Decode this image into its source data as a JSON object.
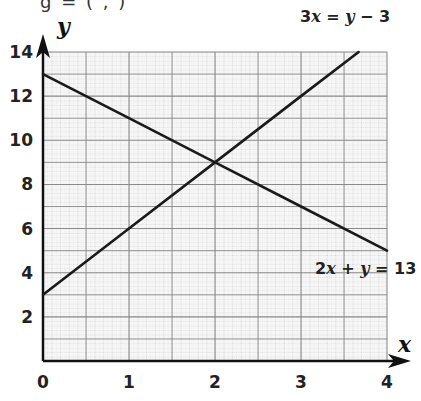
{
  "top_fragment": "g = ( , )",
  "chart_data": {
    "type": "line",
    "title": "",
    "xlabel": "x",
    "ylabel": "y",
    "xlim": [
      0,
      4
    ],
    "ylim": [
      0,
      14
    ],
    "x_ticks": [
      "0",
      "1",
      "2",
      "3",
      "4"
    ],
    "y_ticks": [
      "2",
      "4",
      "6",
      "8",
      "10",
      "12",
      "14"
    ],
    "grid": true,
    "legend_position": "inline labels",
    "series": [
      {
        "name": "3x = y − 3",
        "equation": "y = 3x + 3",
        "label_parts": [
          "3",
          "x",
          " = ",
          "y",
          " − 3"
        ],
        "x": [
          0,
          1,
          2,
          3,
          3.67
        ],
        "values": [
          3,
          6,
          9,
          12,
          14
        ]
      },
      {
        "name": "2x + y = 13",
        "equation": "y = 13 − 2x",
        "label_parts": [
          "2",
          "x",
          " + ",
          "y",
          " = 13"
        ],
        "x": [
          0,
          1,
          2,
          3,
          4
        ],
        "values": [
          13,
          11,
          9,
          7,
          5
        ]
      }
    ],
    "annotations": [
      {
        "type": "intersection",
        "x": 2,
        "y": 9
      }
    ]
  }
}
